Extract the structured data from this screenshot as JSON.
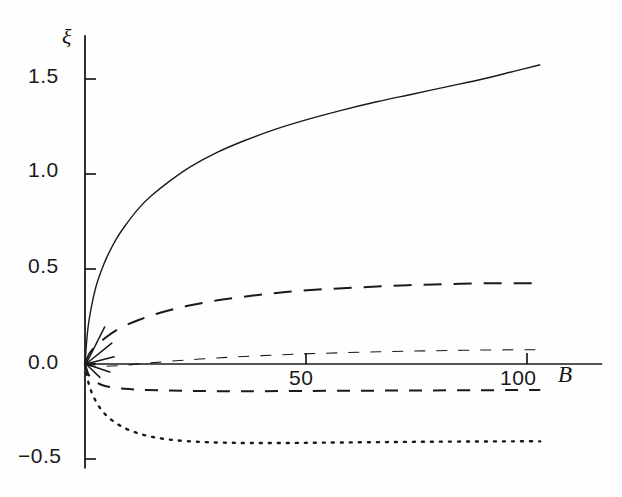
{
  "figure": {
    "name": "xi-versus-B-plot",
    "background": "#ffffff",
    "ink_color": "#1a1a1a"
  },
  "axes": {
    "y_title": "ξ",
    "x_title": "B",
    "y_tick_labels": [
      "1.5",
      "1.0",
      "0.5",
      "0.0",
      "−0.5"
    ],
    "x_tick_labels": [
      "50",
      "100"
    ]
  },
  "chart_data": {
    "type": "line",
    "title": "",
    "subtitle": "",
    "xlabel": "B",
    "ylabel": "ξ",
    "xlim": [
      0,
      115
    ],
    "ylim": [
      -0.55,
      1.73
    ],
    "xticks": [
      50,
      100
    ],
    "yticks": [
      -0.5,
      0.0,
      0.5,
      1.0,
      1.5
    ],
    "xtick_labels": [
      "50",
      "100"
    ],
    "ytick_labels": [
      "−0.5",
      "0.0",
      "0.5",
      "1.0",
      "1.5"
    ],
    "grid": false,
    "legend": null,
    "legend_position": "none",
    "axis_style": {
      "y_axis_at_x": 0,
      "x_axis_at_y": 0.0,
      "spines": [
        "left",
        "bottom-through-zero"
      ],
      "tick_direction": "in-out"
    },
    "annotations": [
      "short straight ray segments emanate from the origin along the initial slope of each curve"
    ],
    "series": [
      {
        "name": "curve-1-solid",
        "style": "solid",
        "dash_pattern": "none",
        "line_width": 1.4,
        "color": "#1a1a1a",
        "x": [
          0,
          0.6,
          1.4,
          2.4,
          3.6,
          5,
          7,
          9,
          12,
          15,
          19,
          24,
          30,
          36,
          43,
          50,
          58,
          66,
          74,
          82,
          90,
          97,
          103
        ],
        "y": [
          0.0,
          0.175,
          0.295,
          0.4,
          0.485,
          0.565,
          0.655,
          0.725,
          0.815,
          0.885,
          0.96,
          1.04,
          1.115,
          1.175,
          1.235,
          1.285,
          1.335,
          1.38,
          1.42,
          1.46,
          1.5,
          1.54,
          1.575
        ]
      },
      {
        "name": "curve-2-long-dash",
        "style": "long-dash",
        "dash_pattern": "18 12",
        "line_width": 2.0,
        "color": "#1a1a1a",
        "x": [
          0,
          1,
          2.5,
          5,
          8,
          12,
          17,
          23,
          30,
          38,
          46,
          55,
          64,
          73,
          82,
          91,
          99,
          103
        ],
        "y": [
          0.0,
          0.055,
          0.095,
          0.145,
          0.19,
          0.23,
          0.27,
          0.305,
          0.335,
          0.36,
          0.38,
          0.395,
          0.405,
          0.415,
          0.42,
          0.425,
          0.425,
          0.425
        ]
      },
      {
        "name": "curve-3-thin-short-dash",
        "style": "short-dash-thin",
        "dash_pattern": "11 11",
        "line_width": 1.1,
        "color": "#1a1a1a",
        "x": [
          0,
          1.5,
          4,
          8,
          13,
          19,
          26,
          34,
          43,
          52,
          62,
          72,
          82,
          92,
          100,
          103
        ],
        "y": [
          0.0,
          -0.01,
          -0.012,
          -0.008,
          0.002,
          0.014,
          0.026,
          0.037,
          0.047,
          0.055,
          0.062,
          0.067,
          0.071,
          0.074,
          0.075,
          0.075
        ]
      },
      {
        "name": "curve-4-medium-dash",
        "style": "medium-dash",
        "dash_pattern": "13 11",
        "line_width": 2.0,
        "color": "#1a1a1a",
        "x": [
          0,
          0.8,
          2,
          4,
          6.5,
          10,
          14,
          19,
          25,
          32,
          40,
          49,
          59,
          69,
          79,
          89,
          98,
          103
        ],
        "y": [
          0.0,
          -0.055,
          -0.088,
          -0.112,
          -0.124,
          -0.132,
          -0.137,
          -0.14,
          -0.142,
          -0.143,
          -0.143,
          -0.142,
          -0.141,
          -0.14,
          -0.139,
          -0.138,
          -0.137,
          -0.137
        ]
      },
      {
        "name": "curve-5-dotted",
        "style": "dotted",
        "dash_pattern": "2 7",
        "line_width": 2.4,
        "color": "#1a1a1a",
        "x": [
          0,
          0.8,
          2,
          3.5,
          5.5,
          8,
          11,
          14.5,
          18.5,
          23,
          28,
          34,
          41,
          49,
          58,
          68,
          78,
          88,
          97,
          103
        ],
        "y": [
          0.0,
          -0.1,
          -0.175,
          -0.235,
          -0.285,
          -0.325,
          -0.357,
          -0.38,
          -0.396,
          -0.406,
          -0.412,
          -0.415,
          -0.416,
          -0.415,
          -0.413,
          -0.411,
          -0.409,
          -0.408,
          -0.407,
          -0.407
        ]
      }
    ],
    "origin_rays": [
      {
        "name": "ray-solid-up",
        "angle_deg": 62,
        "length_px": 42
      },
      {
        "name": "ray-long-dash",
        "angle_deg": 38,
        "length_px": 34
      },
      {
        "name": "ray-thin-dash",
        "angle_deg": 14,
        "length_px": 30
      },
      {
        "name": "ray-down-1",
        "angle_deg": -18,
        "length_px": 26
      },
      {
        "name": "ray-down-2",
        "angle_deg": -42,
        "length_px": 20
      }
    ]
  }
}
